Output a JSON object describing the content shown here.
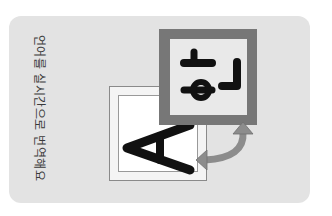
{
  "card": {
    "caption": "언어를 실시간으로 번역해요",
    "orientation": "rotated-90",
    "background": "#e3e3e3"
  },
  "illustration": {
    "source_letter": "A",
    "target_letter": "하",
    "swap_arrow_color": "#8c8c8c",
    "front_frame_color": "#777777"
  }
}
